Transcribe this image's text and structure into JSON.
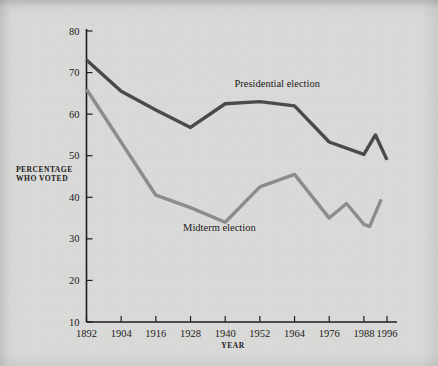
{
  "chart_data": {
    "type": "line",
    "title": "",
    "subtitle": "",
    "xlabel": "YEAR",
    "ylabel": "PERCENTAGE WHO VOTED",
    "ylabel_line1": "PERCENTAGE",
    "ylabel_line2": "WHO VOTED",
    "xlim": [
      1892,
      1996
    ],
    "ylim": [
      10,
      80
    ],
    "grid": false,
    "legend_position": "inline-annotations",
    "x_tick_labels": [
      "1892",
      "1904",
      "1916",
      "1928",
      "1940",
      "1952",
      "1964",
      "1976",
      "1988",
      "1996"
    ],
    "x_tick_values": [
      1892,
      1904,
      1916,
      1928,
      1940,
      1952,
      1964,
      1976,
      1988,
      1996
    ],
    "y_tick_labels": [
      "10",
      "20",
      "30",
      "40",
      "50",
      "60",
      "70",
      "80"
    ],
    "y_tick_values": [
      10,
      20,
      30,
      40,
      50,
      60,
      70,
      80
    ],
    "series": [
      {
        "name": "Presidential election",
        "color": "#4a4a4a",
        "stroke_width": 3.4,
        "label_x": 1958,
        "label_y": 66.5,
        "x": [
          1892,
          1904,
          1916,
          1928,
          1940,
          1952,
          1964,
          1976,
          1988,
          1992,
          1996
        ],
        "values": [
          73.0,
          65.5,
          61.0,
          56.8,
          62.5,
          63.0,
          62.0,
          53.3,
          50.3,
          55.0,
          49.0
        ]
      },
      {
        "name": "Midterm election",
        "color": "#8c8c8c",
        "stroke_width": 3.4,
        "label_x": 1938,
        "label_y": 32.0,
        "x": [
          1892,
          1916,
          1928,
          1940,
          1952,
          1964,
          1976,
          1982,
          1988,
          1990,
          1994
        ],
        "values": [
          66.0,
          40.5,
          37.5,
          34.0,
          42.5,
          45.5,
          35.0,
          38.5,
          33.5,
          33.0,
          39.5
        ]
      }
    ]
  },
  "figure": {
    "background_color": "#d9d9d7",
    "axis_color": "#1b1b1b"
  }
}
